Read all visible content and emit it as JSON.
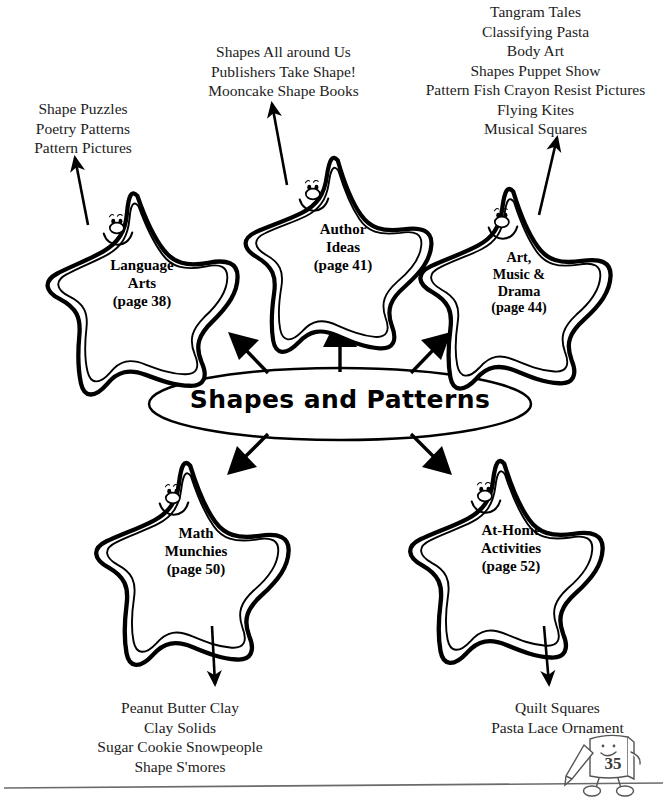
{
  "page": {
    "center_topic": "Shapes and Patterns",
    "page_number": "35",
    "mascot": "book-character-with-pencil"
  },
  "branches": [
    {
      "key": "language_arts",
      "star_lines": [
        "Language",
        "Arts",
        "(page 38)"
      ],
      "activities": [
        "Shape Puzzles",
        "Poetry Patterns",
        "Pattern Pictures"
      ]
    },
    {
      "key": "author_ideas",
      "star_lines": [
        "Author",
        "Ideas",
        "(page 41)"
      ],
      "activities": [
        "Shapes All around Us",
        "Publishers Take Shape!",
        "Mooncake Shape Books"
      ]
    },
    {
      "key": "art_music_drama",
      "star_lines": [
        "Art,",
        "Music &",
        "Drama",
        "(page 44)"
      ],
      "activities": [
        "Tangram Tales",
        "Classifying Pasta",
        "Body Art",
        "Shapes Puppet Show",
        "Pattern Fish Crayon Resist Pictures",
        "Flying Kites",
        "Musical Squares"
      ]
    },
    {
      "key": "math_munchies",
      "star_lines": [
        "Math",
        "Munchies",
        "(page 50)"
      ],
      "activities": [
        "Peanut Butter Clay",
        "Clay Solids",
        "Sugar Cookie Snowpeople",
        "Shape S'mores"
      ]
    },
    {
      "key": "at_home_activities",
      "star_lines": [
        "At-Home",
        "Activities",
        "(page 52)"
      ],
      "activities": [
        "Quilt Squares",
        "Pasta Lace Ornament"
      ]
    }
  ],
  "colors": {
    "ink": "#000000",
    "text": "#1c1c1c",
    "paper": "#ffffff",
    "rule": "#555555"
  }
}
